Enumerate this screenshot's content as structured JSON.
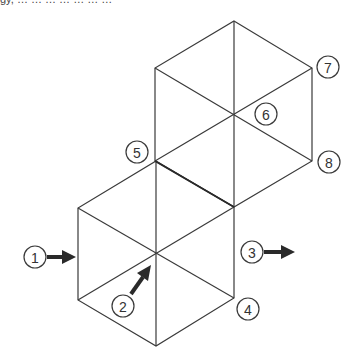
{
  "caption": {
    "text": "gy, … … … … … … …"
  },
  "diagram": {
    "colors": {
      "line": "#3a3a3a",
      "arrow": "#2a2a2a",
      "background": "#ffffff"
    },
    "hexagons": [
      {
        "name": "upper-hexagon",
        "center": [
          234,
          114
        ],
        "vertices": [
          [
            234,
            21
          ],
          [
            312,
            68
          ],
          [
            312,
            161
          ],
          [
            234,
            207
          ],
          [
            155,
            161
          ],
          [
            155,
            68
          ]
        ]
      },
      {
        "name": "lower-hexagon",
        "center": [
          156,
          253
        ],
        "vertices": [
          [
            156,
            161
          ],
          [
            234,
            207
          ],
          [
            234,
            298
          ],
          [
            156,
            346
          ],
          [
            78,
            300
          ],
          [
            78,
            208
          ]
        ]
      }
    ],
    "callouts": [
      {
        "id": "1",
        "label": "1",
        "cx": 35,
        "cy": 257,
        "arrow": "right"
      },
      {
        "id": "2",
        "label": "2",
        "cx": 123,
        "cy": 306,
        "arrow": "up-right"
      },
      {
        "id": "3",
        "label": "3",
        "cx": 252,
        "cy": 252,
        "arrow": "right"
      },
      {
        "id": "4",
        "label": "4",
        "cx": 248,
        "cy": 309,
        "arrow": "none"
      },
      {
        "id": "5",
        "label": "5",
        "cx": 137,
        "cy": 152,
        "arrow": "none"
      },
      {
        "id": "6",
        "label": "6",
        "cx": 266,
        "cy": 114,
        "arrow": "none"
      },
      {
        "id": "7",
        "label": "7",
        "cx": 328,
        "cy": 67,
        "arrow": "none"
      },
      {
        "id": "8",
        "label": "8",
        "cx": 329,
        "cy": 162,
        "arrow": "none"
      }
    ]
  }
}
